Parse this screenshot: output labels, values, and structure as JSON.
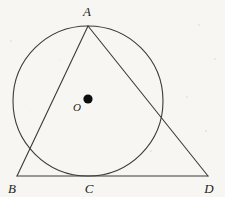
{
  "figure": {
    "kind": "circle-inscribed-triangle-diagram",
    "background_color": "#f7f6f3",
    "stroke_color": "#3a3a3c",
    "dot_color": "#0d0d0d",
    "width": 225,
    "height": 197,
    "circle": {
      "name": "circle-O",
      "cx": 88,
      "cy": 101,
      "r": 75,
      "stroke_width": 1.1
    },
    "center_dot": {
      "name": "center-point-O",
      "cx": 88,
      "cy": 99,
      "r": 4.6
    },
    "points": {
      "A": {
        "x": 88,
        "y": 26
      },
      "B": {
        "x": 17,
        "y": 176
      },
      "C": {
        "x": 90,
        "y": 176
      },
      "D": {
        "x": 208,
        "y": 176
      },
      "O": {
        "x": 88,
        "y": 99
      }
    },
    "segments": [
      {
        "name": "segment-AB",
        "from": "A",
        "to": "B"
      },
      {
        "name": "segment-AD",
        "from": "A",
        "to": "D"
      },
      {
        "name": "segment-BD",
        "from": "B",
        "to": "D"
      }
    ],
    "labels": [
      {
        "name": "label-A",
        "text": "A",
        "x": 87,
        "y": 11,
        "style": "vertex"
      },
      {
        "name": "label-B",
        "text": "B",
        "x": 12,
        "y": 188,
        "style": "vertex"
      },
      {
        "name": "label-C",
        "text": "C",
        "x": 89,
        "y": 188,
        "style": "vertex"
      },
      {
        "name": "label-D",
        "text": "D",
        "x": 209,
        "y": 188,
        "style": "vertex"
      },
      {
        "name": "label-O",
        "text": "O",
        "x": 77,
        "y": 107,
        "style": "center"
      }
    ]
  }
}
